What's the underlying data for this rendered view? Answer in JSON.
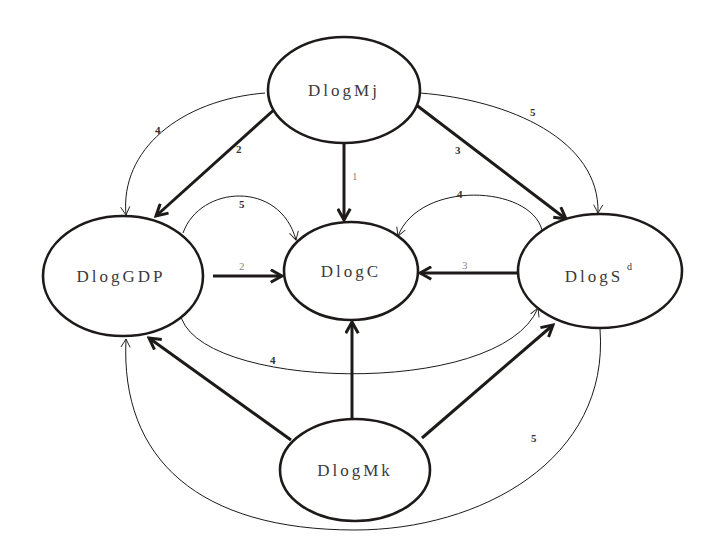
{
  "diagram": {
    "type": "directed-causality-graph",
    "nodes": [
      {
        "id": "mj",
        "label": "DlogMj",
        "cx": 344,
        "cy": 90,
        "rx": 76,
        "ry": 53
      },
      {
        "id": "gdp",
        "label": "DlogGDP",
        "cx": 123,
        "cy": 276,
        "rx": 80,
        "ry": 60
      },
      {
        "id": "c",
        "label": "DlogC",
        "cx": 351,
        "cy": 271,
        "rx": 67,
        "ry": 49
      },
      {
        "id": "sd",
        "label": "DlogS",
        "label_sup": "d",
        "cx": 600,
        "cy": 271,
        "rx": 82,
        "ry": 57
      },
      {
        "id": "mk",
        "label": "DlogMk",
        "cx": 355,
        "cy": 470,
        "rx": 75,
        "ry": 51
      }
    ],
    "edges": [
      {
        "from": "mj",
        "to": "c",
        "label": "1",
        "weight": "thick"
      },
      {
        "from": "mj",
        "to": "gdp",
        "label": "2",
        "weight": "thick"
      },
      {
        "from": "mj",
        "to": "sd",
        "label": "3",
        "weight": "thick"
      },
      {
        "from": "mj",
        "to": "gdp",
        "label": "4",
        "weight": "thin"
      },
      {
        "from": "mj",
        "to": "sd",
        "label": "5",
        "weight": "thin"
      },
      {
        "from": "gdp",
        "to": "c",
        "label": "2",
        "weight": "thick"
      },
      {
        "from": "gdp",
        "to": "c",
        "label": "5",
        "weight": "thin"
      },
      {
        "from": "sd",
        "to": "c",
        "label": "3",
        "weight": "thick"
      },
      {
        "from": "sd",
        "to": "c",
        "label": "4",
        "weight": "thin"
      },
      {
        "from": "gdp",
        "to": "sd",
        "label": "4",
        "weight": "thin"
      },
      {
        "from": "mk",
        "to": "gdp",
        "label": "",
        "weight": "thick"
      },
      {
        "from": "mk",
        "to": "c",
        "label": "",
        "weight": "thick"
      },
      {
        "from": "mk",
        "to": "sd",
        "label": "",
        "weight": "thick"
      },
      {
        "from": "sd",
        "to": "gdp",
        "label": "5",
        "weight": "thin"
      }
    ]
  },
  "labels": {
    "mj": "DlogMj",
    "gdp": "DlogGDP",
    "c": "DlogC",
    "sd": "DlogS",
    "sd_sup": "d",
    "mk": "DlogMk",
    "e_mj_c": "1",
    "e_mj_gdp_thick": "2",
    "e_mj_sd_thick": "3",
    "e_mj_gdp_thin": "4",
    "e_mj_sd_thin": "5",
    "e_gdp_c_thick": "2",
    "e_gdp_c_thin": "5",
    "e_sd_c_thick": "3",
    "e_sd_c_thin": "4",
    "e_gdp_sd_thin": "4",
    "e_sd_gdp_thin": "5"
  },
  "colors": {
    "stroke": "#1e1a1a",
    "background": "#ffffff"
  }
}
